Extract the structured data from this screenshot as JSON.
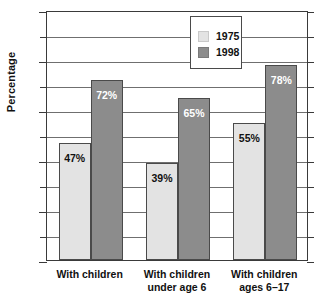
{
  "chart_data": {
    "type": "bar",
    "title": "",
    "xlabel": "",
    "ylabel": "Percentage",
    "ylim": [
      0,
      100
    ],
    "ytick_step": 20,
    "gridline_step": 10,
    "grid": true,
    "legend_position": "top-center",
    "categories": [
      "With children",
      "With children under age 6",
      "With children ages 6–17"
    ],
    "category_lines": [
      [
        "With children",
        ""
      ],
      [
        "With children",
        "under age 6"
      ],
      [
        "With children",
        "ages 6–17"
      ]
    ],
    "series": [
      {
        "name": "1975",
        "color": "#e3e3e3",
        "values": [
          47,
          39,
          55
        ],
        "labels": [
          "47%",
          "39%",
          "55%"
        ]
      },
      {
        "name": "1998",
        "color": "#8c8c8c",
        "values": [
          72,
          65,
          78
        ],
        "labels": [
          "72%",
          "65%",
          "78%"
        ]
      }
    ],
    "ytick_labels": [
      "0",
      "20",
      "40",
      "60",
      "80",
      "100"
    ],
    "ytick_values": [
      0,
      20,
      40,
      60,
      80,
      100
    ]
  },
  "axis": {
    "y_title": "Percentage"
  },
  "legend": {
    "entries": [
      {
        "label": "1975",
        "swatch": "light-gray-swatch"
      },
      {
        "label": "1998",
        "swatch": "dark-gray-swatch"
      }
    ]
  },
  "colors": {
    "series_1975": "#e3e3e3",
    "series_1998": "#8c8c8c",
    "axis": "#3a3a3a",
    "gridline": "#6f6f6f",
    "background": "#ffffff",
    "text": "#111111"
  }
}
